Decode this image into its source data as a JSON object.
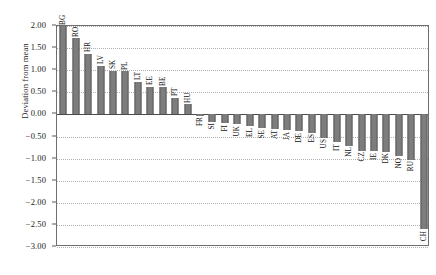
{
  "axis": {
    "ylabel": "Deviation from mean",
    "yticks": [
      "2.00",
      "1.50",
      "1.00",
      "0.50",
      "0.00",
      "-0.50",
      "-1.00",
      "-1.50",
      "-2.00",
      "-2.50",
      "-3.00"
    ],
    "ytick_values": [
      2.0,
      1.5,
      1.0,
      0.5,
      0.0,
      -0.5,
      -1.0,
      -1.5,
      -2.0,
      -2.5,
      -3.0
    ],
    "ymin": -3.0,
    "ymax": 2.0
  },
  "style": {
    "bar_color": "#7d7d7d",
    "bar_edge_color": "#5c5c5c",
    "grid_color": "#b0b0b0",
    "frame_color": "#6f6f6f",
    "background": "#ffffff"
  },
  "chart_data": {
    "type": "bar",
    "title": "",
    "xlabel": "",
    "ylabel": "Deviation from mean",
    "ylim": [
      -3.0,
      2.0
    ],
    "grid": true,
    "legend": "none",
    "categories": [
      "BG",
      "RO",
      "HR",
      "LV",
      "SK",
      "PL",
      "LT",
      "EE",
      "BE",
      "PT",
      "HU",
      "FR",
      "SI",
      "FI",
      "UK",
      "EL",
      "SE",
      "AT",
      "JA",
      "DE",
      "ES",
      "US",
      "IT",
      "NL",
      "CZ",
      "IE",
      "DK",
      "NO",
      "RU",
      "CH"
    ],
    "values": [
      2.0,
      1.72,
      1.37,
      1.1,
      0.99,
      0.98,
      0.74,
      0.63,
      0.61,
      0.38,
      0.23,
      -0.03,
      -0.17,
      -0.2,
      -0.22,
      -0.27,
      -0.31,
      -0.33,
      -0.36,
      -0.38,
      -0.41,
      -0.53,
      -0.63,
      -0.71,
      -0.82,
      -0.83,
      -0.85,
      -0.95,
      -1.03,
      -2.6
    ]
  }
}
